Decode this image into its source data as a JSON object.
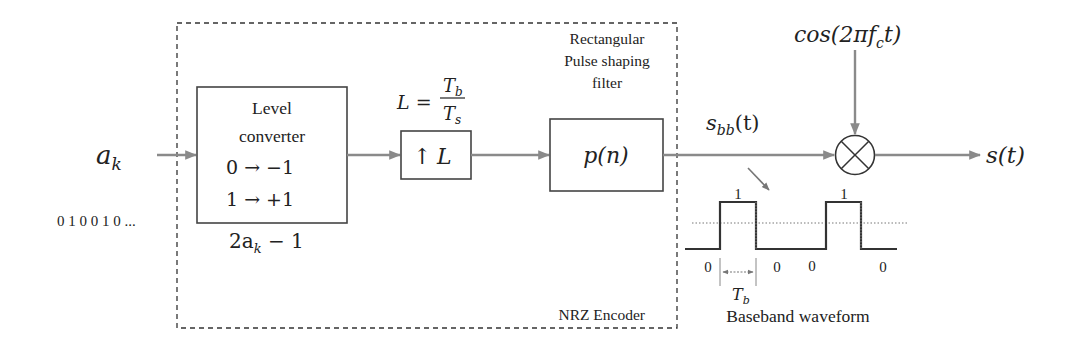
{
  "diagram": {
    "input": {
      "symbol": "a",
      "subscript": "k",
      "bit_sequence": "0 1 0 0 1 0 ..."
    },
    "encoder_group": {
      "label": "NRZ Encoder"
    },
    "level_converter": {
      "line1": "Level",
      "line2": "converter",
      "map0": "0 → −1",
      "map1": "1 → +1",
      "formula_pre": "2a",
      "formula_sub": "k",
      "formula_post": " − 1"
    },
    "upsampler": {
      "label_arrow": "↑",
      "label_var": "L",
      "ratio_lhs": "L =",
      "ratio_num": "T",
      "ratio_num_sub": "b",
      "ratio_den": "T",
      "ratio_den_sub": "s"
    },
    "pulse_filter": {
      "title_line1": "Rectangular",
      "title_line2": "Pulse shaping",
      "title_line3": "filter",
      "label": "p(n)"
    },
    "baseband_signal": {
      "label_pre": "s",
      "label_sub": "bb",
      "label_post": "(t)"
    },
    "carrier": {
      "label_pre": "cos(2π",
      "label_f": "f",
      "label_sub": "c",
      "label_post": "t)"
    },
    "mixer": {
      "symbol": "multiplier"
    },
    "output": {
      "label": "s(t)"
    },
    "waveform": {
      "caption": "Baseband waveform",
      "high_labels": [
        "1",
        "1"
      ],
      "low_labels": [
        "0",
        "0",
        "0",
        "0"
      ],
      "bit_period_label": "T",
      "bit_period_sub": "b"
    }
  }
}
